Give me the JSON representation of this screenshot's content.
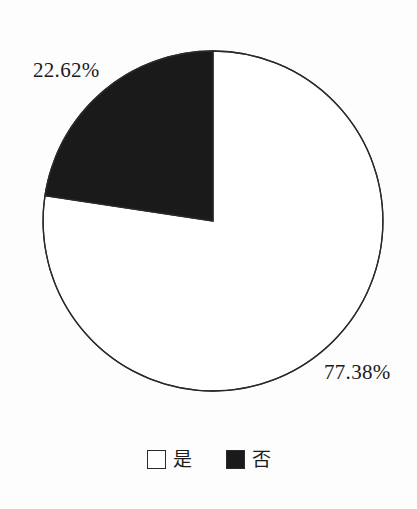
{
  "chart_data": {
    "type": "pie",
    "title": "",
    "categories": [
      "是",
      "否"
    ],
    "values": [
      77.38,
      22.62
    ],
    "labels": [
      "77.38%",
      "22.62%"
    ],
    "units": "percent",
    "start_angle_deg": 90,
    "direction": "counterclockwise",
    "legend_position": "bottom",
    "grid": false,
    "slices": [
      {
        "name": "是",
        "value": 77.38,
        "label": "77.38%",
        "color": "#ffffff",
        "border_color": "#2a2a2a"
      },
      {
        "name": "否",
        "value": 22.62,
        "label": "22.62%",
        "color": "#1a1a1a",
        "border_color": "#2a2a2a"
      }
    ]
  },
  "chart": {
    "slice_no_label": "22.62%",
    "slice_yes_label": "77.38%",
    "outline_color": "#2a2a2a",
    "fill_dark": "#1a1a1a",
    "fill_light": "#ffffff",
    "center_x": 213,
    "center_y": 221,
    "radius": 170
  },
  "legend": {
    "items": [
      {
        "label": "是",
        "swatch_fill": "#ffffff",
        "swatch_name": "legend-swatch-yes"
      },
      {
        "label": "否",
        "swatch_fill": "#1a1a1a",
        "swatch_name": "legend-swatch-no"
      }
    ]
  }
}
